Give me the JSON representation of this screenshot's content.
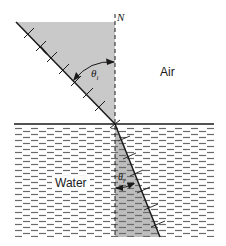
{
  "labels": {
    "normal": "N",
    "upper_medium": "Air",
    "lower_medium": "Water",
    "incidence_angle": "θ",
    "incidence_angle_sub": "i",
    "refraction_angle": "θ",
    "refraction_angle_sub": "r"
  },
  "colors": {
    "shading": "#c9c9c9",
    "line": "#1a1a1a",
    "water_dash": "#6a6a6a",
    "background": "#ffffff"
  }
}
